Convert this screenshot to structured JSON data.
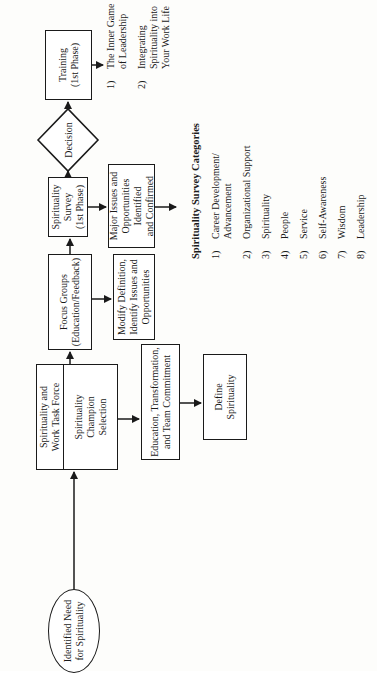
{
  "diagram": {
    "start": {
      "label": "Identified Need\nfor Spirituality"
    },
    "task_force": {
      "top_label": "Spirituality and\nWork Task Force",
      "bottom_label": "Spirituality\nChampion\nSelection"
    },
    "education": {
      "label": "Education, Transformation,\nand Team Commitment"
    },
    "define": {
      "label": "Define\nSpirituality"
    },
    "focus_groups": {
      "label": "Focus Groups\n(Education/Feedback)"
    },
    "modify": {
      "label": "Modify Definition,\nIdentify Issues and\nOpportunities"
    },
    "survey": {
      "label": "Spirituality\nSurvey\n(1st Phase)"
    },
    "major_issues": {
      "label": "Major Issues and\nOpportunities\nIdentified\nand Confirmed"
    },
    "decision": {
      "label": "Decision"
    },
    "training": {
      "label": "Training\n(1st Phase)"
    },
    "training_items": [
      {
        "num": "1)",
        "label": "The Inner Game\nof Leadership"
      },
      {
        "num": "2)",
        "label": "Integrating\nSpirituality into\nYour Work Life"
      }
    ],
    "categories": {
      "title": "Spirituality Survey Categories",
      "items": [
        {
          "num": "1)",
          "label": "Career Development/\nAdvancement"
        },
        {
          "num": "2)",
          "label": "Organizational Support"
        },
        {
          "num": "3)",
          "label": "Spirituality"
        },
        {
          "num": "4)",
          "label": "People"
        },
        {
          "num": "5)",
          "label": "Service"
        },
        {
          "num": "6)",
          "label": "Self-Awareness"
        },
        {
          "num": "7)",
          "label": "Wisdom"
        },
        {
          "num": "8)",
          "label": "Leadership"
        }
      ]
    }
  }
}
